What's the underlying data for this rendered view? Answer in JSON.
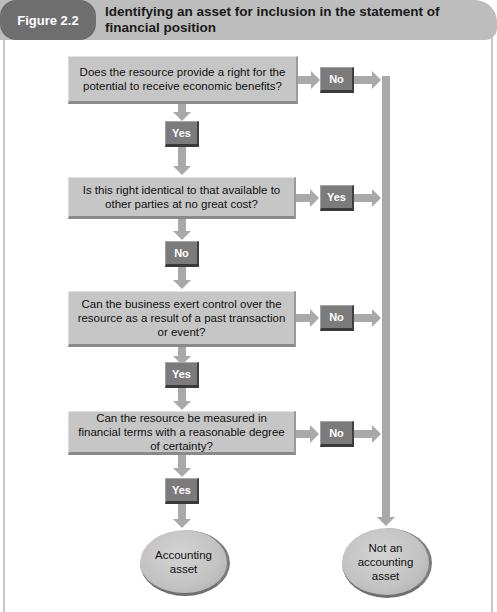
{
  "figure": {
    "label": "Figure 2.2",
    "title": "Identifying an asset for inclusion in the statement of financial position"
  },
  "questions": [
    {
      "text": "Does the resource provide a right for the potential to receive economic benefits?",
      "down_label": "Yes",
      "side_label": "No"
    },
    {
      "text": "Is this right identical to that available to other parties at no great cost?",
      "down_label": "No",
      "side_label": "Yes"
    },
    {
      "text": "Can the business exert control over the resource as a result of a past transaction or event?",
      "down_label": "Yes",
      "side_label": "No"
    },
    {
      "text": "Can the resource be measured in financial terms with a reasonable degree of certainty?",
      "down_label": "Yes",
      "side_label": "No"
    }
  ],
  "outcomes": {
    "positive": "Accounting asset",
    "negative": "Not an accounting asset"
  },
  "colors": {
    "header_bar": "#bdbdbd",
    "figure_label_bg": "#6e6e6e",
    "question_box": "#c6c6c6",
    "badge": "#7b7b7b",
    "arrow": "#a9a9a9"
  }
}
